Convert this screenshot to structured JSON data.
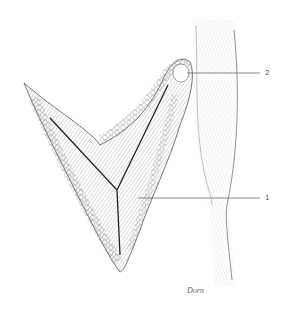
{
  "figure": {
    "labels": [
      {
        "id": "1",
        "text": "1",
        "x": 266,
        "y": 197
      },
      {
        "id": "2",
        "text": "2",
        "x": 266,
        "y": 73
      }
    ],
    "signature": "Dorn",
    "colors": {
      "ink": "#333333",
      "shade": "#9a9a9a",
      "background": "#ffffff"
    }
  }
}
